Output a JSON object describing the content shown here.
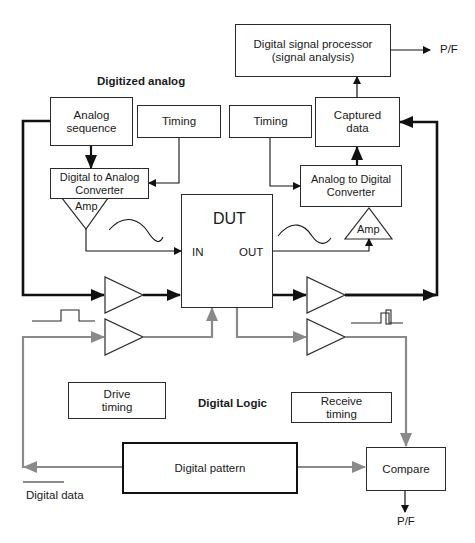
{
  "diagram": {
    "sections": {
      "analog_title": "Digitized analog",
      "digital_title": "Digital Logic"
    },
    "blocks": {
      "dsp": {
        "line1": "Digital signal processor",
        "line2": "(signal analysis)"
      },
      "analog_sequence": {
        "line1": "Analog",
        "line2": "sequence"
      },
      "timing_left": {
        "label": "Timing"
      },
      "timing_right": {
        "label": "Timing"
      },
      "captured_data": {
        "line1": "Captured",
        "line2": "data"
      },
      "dac": {
        "line1": "Digital to Analog",
        "line2": "Converter"
      },
      "adc": {
        "line1": "Analog to Digital",
        "line2": "Converter"
      },
      "amp_left": {
        "label": "Amp"
      },
      "amp_right": {
        "label": "Amp"
      },
      "dut": {
        "title": "DUT",
        "in": "IN",
        "out": "OUT"
      },
      "drive_timing": {
        "line1": "Drive",
        "line2": "timing"
      },
      "receive_timing": {
        "line1": "Receive",
        "line2": "timing"
      },
      "digital_pattern": {
        "label": "Digital pattern"
      },
      "compare": {
        "label": "Compare"
      }
    },
    "outputs": {
      "dsp_pf": "P/F",
      "compare_pf": "P/F"
    },
    "legend": {
      "digital_data": {
        "label": "Digital data",
        "color": "#8a8a8a"
      }
    },
    "colors": {
      "analog_path": "#111111",
      "digital_path": "#8a8a8a",
      "outline": "#2a2a2a"
    }
  }
}
